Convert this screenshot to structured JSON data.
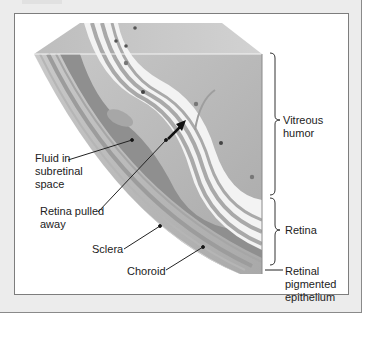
{
  "figure": {
    "labels": {
      "vitreous_humor": "Vitreous\nhumor",
      "retina": "Retina",
      "retinal_pigmented_epithelium": "Retinal\npigmented\nepithelium",
      "fluid_subretinal": "Fluid in\nsubretinal\nspace",
      "retina_pulled_away": "Retina pulled\naway",
      "sclera": "Sclera",
      "choroid": "Choroid"
    }
  },
  "colors": {
    "frame_bg": "#ececec",
    "panel_bg": "#ffffff",
    "vitreous": "#b9b9b9",
    "retina_light": "#f2f2f2",
    "retina_stripe": "#a8a8a8",
    "sclera": "#cfcfcf",
    "choroid": "#9a9a9a",
    "subretinal_fluid": "#8e8e8e"
  }
}
